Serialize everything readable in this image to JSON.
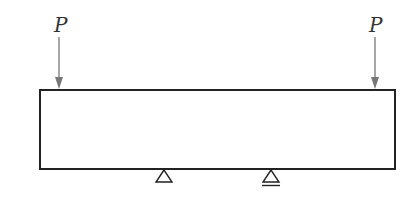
{
  "diagram": {
    "type": "beam-loading",
    "colors": {
      "beam_stroke": "#222222",
      "arrow": "#777777",
      "label": "#333333",
      "support": "#222222"
    },
    "loads": [
      {
        "label": "P",
        "position": "left-end",
        "direction": "down"
      },
      {
        "label": "P",
        "position": "right-end",
        "direction": "down"
      }
    ],
    "supports": [
      {
        "type": "pin",
        "symbol": "triangle"
      },
      {
        "type": "roller",
        "symbol": "triangle-with-base-lines"
      }
    ]
  }
}
